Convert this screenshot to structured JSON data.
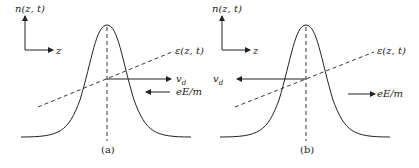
{
  "diagram": {
    "colors": {
      "stroke": "#222222",
      "background": "#ffffff"
    },
    "panels": [
      {
        "id": "a",
        "caption": "(a)",
        "axis_y_label": "n(z, t)",
        "axis_x_label": "z",
        "potential_label": "ε(z, t)",
        "drift_label": "v",
        "drift_subscript": "d",
        "drift_direction": "right",
        "force_label": "eE/m",
        "force_direction": "left"
      },
      {
        "id": "b",
        "caption": "(b)",
        "axis_y_label": "n(z, t)",
        "axis_x_label": "z",
        "potential_label": "ε(z, t)",
        "drift_label": "v",
        "drift_subscript": "d",
        "drift_direction": "left",
        "force_label": "eE/m",
        "force_direction": "right"
      }
    ]
  }
}
